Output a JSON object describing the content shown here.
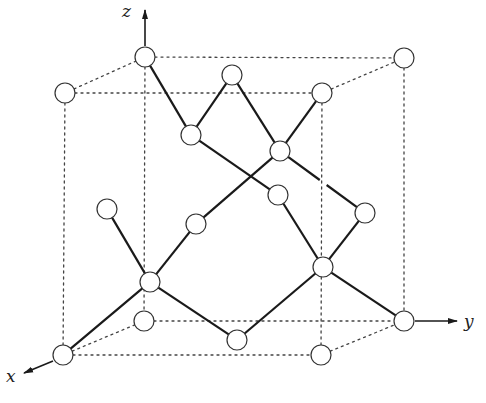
{
  "figure": {
    "type": "diamond-cubic-crystal-structure",
    "axes": {
      "x_label": "x",
      "y_label": "y",
      "z_label": "z"
    },
    "caption_visible": "partially cut off at bottom edge"
  },
  "atoms": [
    {
      "id": "a1",
      "x": 145,
      "y": 57
    },
    {
      "id": "a2",
      "x": 404,
      "y": 58
    },
    {
      "id": "a3",
      "x": 232,
      "y": 75
    },
    {
      "id": "a4",
      "x": 65,
      "y": 93
    },
    {
      "id": "a5",
      "x": 322,
      "y": 93
    },
    {
      "id": "a6",
      "x": 191,
      "y": 135
    },
    {
      "id": "a7",
      "x": 280,
      "y": 151
    },
    {
      "id": "a8",
      "x": 278,
      "y": 195
    },
    {
      "id": "a9",
      "x": 107,
      "y": 209
    },
    {
      "id": "a10",
      "x": 365,
      "y": 213
    },
    {
      "id": "a11",
      "x": 196,
      "y": 224
    },
    {
      "id": "a12",
      "x": 323,
      "y": 267
    },
    {
      "id": "a13",
      "x": 150,
      "y": 282
    },
    {
      "id": "a14",
      "x": 144,
      "y": 321
    },
    {
      "id": "a15",
      "x": 404,
      "y": 321
    },
    {
      "id": "a16",
      "x": 237,
      "y": 340
    },
    {
      "id": "a17",
      "x": 63,
      "y": 355
    },
    {
      "id": "a18",
      "x": 321,
      "y": 355
    }
  ],
  "bonds": [
    [
      "a1",
      "a6"
    ],
    [
      "a3",
      "a6"
    ],
    [
      "a3",
      "a7"
    ],
    [
      "a5",
      "a7"
    ],
    [
      "a6",
      "a8"
    ],
    [
      "a7",
      "a11"
    ],
    [
      "a7",
      "a10"
    ],
    [
      "a8",
      "a12"
    ],
    [
      "a10",
      "a12"
    ],
    [
      "a9",
      "a13"
    ],
    [
      "a11",
      "a13"
    ],
    [
      "a13",
      "a17"
    ],
    [
      "a13",
      "a16"
    ],
    [
      "a16",
      "a12"
    ],
    [
      "a12",
      "a15"
    ]
  ],
  "cube_edges": [
    [
      "a4",
      "a1"
    ],
    [
      "a1",
      "a2"
    ],
    [
      "a4",
      "a5"
    ],
    [
      "a5",
      "a2"
    ],
    [
      "a17",
      "a14"
    ],
    [
      "a14",
      "a15"
    ],
    [
      "a17",
      "a18"
    ],
    [
      "a18",
      "a15"
    ],
    [
      "a4",
      "a17"
    ],
    [
      "a1",
      "a14"
    ],
    [
      "a5",
      "a18"
    ],
    [
      "a2",
      "a15"
    ]
  ]
}
